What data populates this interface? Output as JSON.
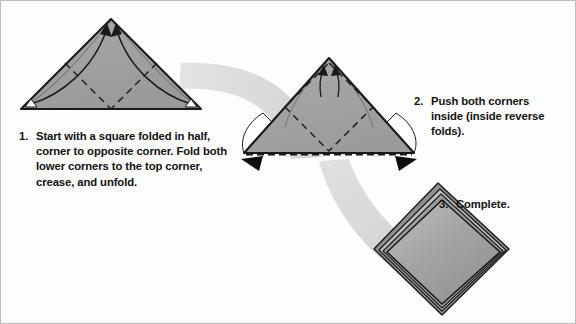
{
  "document": {
    "kind": "origami-instruction-diagram",
    "title": "Origami folding steps"
  },
  "colors": {
    "paper_fill": "#9e9e9e",
    "paper_fill_light": "#b4b4b4",
    "paper_fill_dark": "#8a8a8a",
    "outline": "#1a1a1a",
    "motion_ribbon": "#dcdcdc",
    "background": "#fdfdfd",
    "border": "#bdbdbd",
    "text": "#121212",
    "white": "#ffffff"
  },
  "steps": [
    {
      "number": "1.",
      "text": "Start with a square folded in half, corner to opposite corner. Fold both lower corners to the top corner, crease, and unfold.",
      "figure": "triangle-with-fold-arrows"
    },
    {
      "number": "2.",
      "text": "Push both corners inside (inside reverse folds).",
      "figure": "triangle-with-push-arrows"
    },
    {
      "number": "3.",
      "text": "Complete.",
      "figure": "finished-diamond"
    }
  ],
  "figure_1": {
    "name": "folded-triangle-step1",
    "apex": [
      110,
      18
    ],
    "left_corner": [
      20,
      108
    ],
    "right_corner": [
      200,
      108
    ],
    "arrow_labels": [
      "fold-left-corner-to-apex",
      "fold-right-corner-to-apex"
    ],
    "crease_style": "dashed-valley-fold"
  },
  "figure_2": {
    "name": "folded-triangle-step2",
    "apex": [
      328,
      57
    ],
    "left_corner": [
      243,
      152
    ],
    "right_corner": [
      413,
      152
    ],
    "arrow_labels": [
      "push-left-corner-inside",
      "push-right-corner-inside"
    ],
    "crease_style": "dashed-diamond",
    "bottom_edge_style": "dashed-open-edge"
  },
  "figure_3": {
    "name": "finished-diamond-step3",
    "top": [
      437,
      186
    ],
    "right": [
      505,
      248
    ],
    "bottom": [
      441,
      310
    ],
    "left": [
      377,
      248
    ],
    "layers": "stacked-edges-upper-left"
  },
  "motion_ribbons": [
    {
      "name": "ribbon-step1-to-step2"
    },
    {
      "name": "ribbon-step2-to-step3"
    }
  ]
}
